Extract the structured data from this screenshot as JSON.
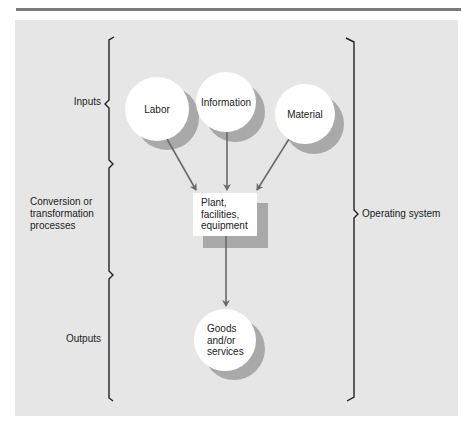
{
  "diagram": {
    "stages": [
      {
        "id": "inputs",
        "label": "Inputs"
      },
      {
        "id": "conversion",
        "label": "Conversion or transformation processes",
        "lines": [
          "Conversion or",
          "transformation",
          "processes"
        ]
      },
      {
        "id": "outputs",
        "label": "Outputs"
      }
    ],
    "system_label": "Operating system",
    "nodes": {
      "labor": "Labor",
      "information": "Information",
      "material": "Material",
      "process": {
        "lines": [
          "Plant,",
          "facilities,",
          "equipment"
        ]
      },
      "output": {
        "lines": [
          "Goods",
          "and/or",
          "services"
        ]
      }
    },
    "edges": [
      {
        "from": "Labor",
        "to": "Plant, facilities, equipment"
      },
      {
        "from": "Information",
        "to": "Plant, facilities, equipment"
      },
      {
        "from": "Material",
        "to": "Plant, facilities, equipment"
      },
      {
        "from": "Plant, facilities, equipment",
        "to": "Goods and/or services"
      }
    ],
    "colors": {
      "panel": "#e6e6e6",
      "rule": "#7a7a7a",
      "node_fill": "#ffffff",
      "shadow": "#a9a9a9",
      "arrow": "#6a6a6a",
      "brace": "#222222"
    }
  }
}
